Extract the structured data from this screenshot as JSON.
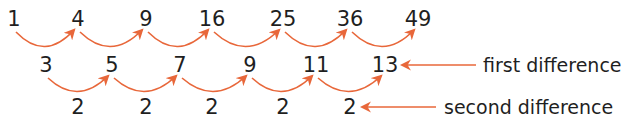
{
  "colors": {
    "arrow": "#e8673a",
    "text": "#1f1f1f"
  },
  "rows": {
    "sequence": {
      "values": [
        "1",
        "4",
        "9",
        "16",
        "25",
        "36",
        "49"
      ],
      "x": [
        14,
        78,
        146,
        212,
        283,
        350,
        418
      ],
      "y": 26
    },
    "first_difference": {
      "values": [
        "3",
        "5",
        "7",
        "9",
        "11",
        "13"
      ],
      "x": [
        46,
        112,
        180,
        250,
        316,
        385
      ],
      "y": 72
    },
    "second_difference": {
      "values": [
        "2",
        "2",
        "2",
        "2",
        "2"
      ],
      "x": [
        78,
        146,
        212,
        283,
        350
      ],
      "y": 114
    }
  },
  "labels": {
    "first_difference": {
      "text": "first difference",
      "x": 483,
      "y": 72,
      "arrow_from": 476,
      "arrow_to": 402
    },
    "second_difference": {
      "text": "second difference",
      "x": 444,
      "y": 114,
      "arrow_from": 436,
      "arrow_to": 362
    }
  }
}
